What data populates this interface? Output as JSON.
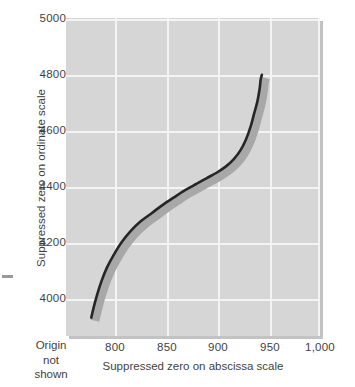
{
  "chart_data": {
    "type": "line",
    "title": "",
    "xlabel": "Suppressed zero on abscissa scale",
    "ylabel": "Suppressed zero on ordinate scale",
    "xlim": [
      775,
      1000
    ],
    "ylim": [
      3880,
      5000
    ],
    "grid": true,
    "legend": "none",
    "x_ticks": [
      800,
      850,
      900,
      950,
      1000
    ],
    "x_tick_labels": [
      "800",
      "850",
      "900",
      "950",
      "1,000"
    ],
    "y_ticks": [
      4000,
      4200,
      4400,
      4600,
      4800,
      5000
    ],
    "y_tick_labels": [
      "4000",
      "4200",
      "4400",
      "4600",
      "4800",
      "5000"
    ],
    "annotations": [
      "Origin",
      "not",
      "shown"
    ],
    "series": [
      {
        "name": "curve",
        "style": "solid-dark-with-shadow",
        "color": "#262626",
        "shadow_color": "#a8a8a8",
        "x": [
          798,
          800,
          803,
          807,
          812,
          818,
          825,
          833,
          842,
          852,
          862,
          872,
          882,
          892,
          901,
          910,
          918,
          925,
          931,
          936,
          940,
          943,
          946,
          948,
          949,
          950
        ],
        "y": [
          3930,
          3965,
          4010,
          4060,
          4110,
          4155,
          4200,
          4240,
          4275,
          4305,
          4335,
          4362,
          4388,
          4410,
          4430,
          4450,
          4472,
          4498,
          4530,
          4570,
          4615,
          4660,
          4705,
          4750,
          4785,
          4800
        ]
      }
    ]
  },
  "labels": {
    "x_axis_title": "Suppressed zero on abscissa scale",
    "y_axis_title": "Suppressed zero on ordinate scale",
    "origin_note_line1": "Origin",
    "origin_note_line2": "not",
    "origin_note_line3": "shown",
    "x_ticks": [
      "800",
      "850",
      "900",
      "950",
      "1,000"
    ],
    "y_ticks": [
      "5000",
      "4800",
      "4600",
      "4400",
      "4200",
      "4000"
    ]
  },
  "colors": {
    "panel_bg": "#d6d6d6",
    "panel_shadow": "#c3c3c3",
    "gridline": "#f4f4f4",
    "curve": "#262626",
    "curve_shadow": "#a8a8a8",
    "text": "#3f3f3f"
  }
}
